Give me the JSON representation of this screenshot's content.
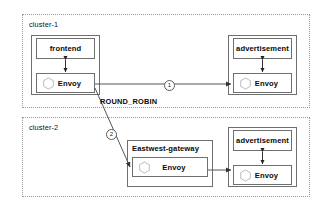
{
  "diagram": {
    "colors": {
      "cluster_border": "#9a9a9a",
      "box_border": "#6f6f6f",
      "edge": "#555555",
      "text": "#0a0a0a",
      "background": "#ffffff"
    },
    "clusters": [
      {
        "id": "cluster-1",
        "label": "cluster-1",
        "groups": [
          {
            "id": "frontend-group",
            "nodes": [
              {
                "id": "frontend",
                "label": "frontend",
                "icon": null
              },
              {
                "id": "frontend-envoy",
                "label": "Envoy",
                "icon": "hexagon-icon"
              }
            ]
          },
          {
            "id": "advertisement-group-1",
            "nodes": [
              {
                "id": "advertisement-1",
                "label": "advertisement",
                "icon": null
              },
              {
                "id": "advertisement-envoy-1",
                "label": "Envoy",
                "icon": "hexagon-icon"
              }
            ]
          }
        ]
      },
      {
        "id": "cluster-2",
        "label": "cluster-2",
        "groups": [
          {
            "id": "eastwest-gateway-group",
            "label": "Eastwest-gateway",
            "nodes": [
              {
                "id": "eastwest-gateway-envoy",
                "label": "Envoy",
                "icon": "hexagon-icon"
              }
            ]
          },
          {
            "id": "advertisement-group-2",
            "nodes": [
              {
                "id": "advertisement-2",
                "label": "advertisement",
                "icon": null
              },
              {
                "id": "advertisement-envoy-2",
                "label": "Envoy",
                "icon": "hexagon-icon"
              }
            ]
          }
        ]
      }
    ],
    "edges": [
      {
        "id": "edge-1",
        "from": "frontend-envoy",
        "to": "advertisement-envoy-1",
        "marker": "①",
        "marker_text": "1",
        "style": "solid",
        "direction": "forward"
      },
      {
        "id": "edge-2",
        "from": "frontend-envoy",
        "to": "eastwest-gateway-envoy",
        "marker": "②",
        "marker_text": "2",
        "style": "solid",
        "direction": "forward"
      },
      {
        "id": "edge-3",
        "from": "eastwest-gateway-envoy",
        "to": "advertisement-envoy-2",
        "marker": null,
        "style": "solid",
        "direction": "forward"
      },
      {
        "id": "edge-frontend-sidecar",
        "from": "frontend",
        "to": "frontend-envoy",
        "style": "solid",
        "direction": "both"
      },
      {
        "id": "edge-advertisement-sidecar-1",
        "from": "advertisement-1",
        "to": "advertisement-envoy-1",
        "style": "solid",
        "direction": "both"
      },
      {
        "id": "edge-advertisement-sidecar-2",
        "from": "advertisement-2",
        "to": "advertisement-envoy-2",
        "style": "solid",
        "direction": "both"
      }
    ],
    "annotations": [
      {
        "id": "load-balancing-policy",
        "label": "ROUND_ROBIN"
      }
    ]
  }
}
